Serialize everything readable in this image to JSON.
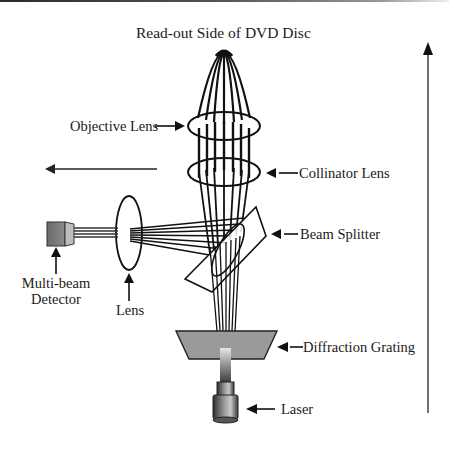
{
  "title": "Read-out Side of DVD Disc",
  "labels": {
    "objective_lens": "Objective Lens",
    "collinator_lens": "Collinator Lens",
    "beam_splitter": "Beam Splitter",
    "detector_line1": "Multi-beam",
    "detector_line2": "Detector",
    "lens": "Lens",
    "diffraction_grating": "Diffraction Grating",
    "laser": "Laser"
  },
  "colors": {
    "line": "#111111",
    "grating_fill": "#9a9a9a",
    "detector_dark": "#6e6e6e",
    "detector_light": "#b8b8b8",
    "axis_arrow": "#333333"
  }
}
